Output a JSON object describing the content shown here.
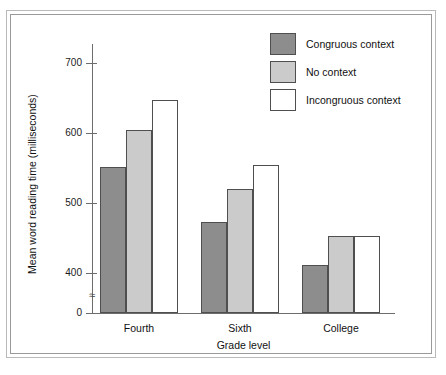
{
  "chart_data": {
    "type": "bar",
    "title": "",
    "subtitle": "",
    "xlabel": "Grade level",
    "ylabel": "Mean word reading time (milliseconds)",
    "categories": [
      "Fourth",
      "Sixth",
      "College"
    ],
    "series": [
      {
        "name": "Congruous context",
        "values": [
          551,
          473,
          412
        ],
        "color": "#8d8d8d"
      },
      {
        "name": "No context",
        "values": [
          604,
          520,
          453
        ],
        "color": "#cbcbcb"
      },
      {
        "name": "Incongruous context",
        "values": [
          647,
          555,
          453
        ],
        "color": "#ffffff"
      }
    ],
    "ylim": [
      0,
      730
    ],
    "y_ticks": [
      0,
      400,
      500,
      600,
      700
    ],
    "y_tick_labels": [
      "0",
      "400",
      "500",
      "600",
      "700"
    ],
    "axis_break": true,
    "axis_break_symbol": "≈",
    "grid": false,
    "legend_position": "top-right",
    "bar_edge_color": "#4f4f4f",
    "axis_color": "#6d6d6d",
    "text_color": "#111111",
    "background": "#ffffff"
  },
  "figure": {
    "frame_outer_color": "#b9b9b9",
    "frame_inner_color": "#9a9a9a"
  }
}
